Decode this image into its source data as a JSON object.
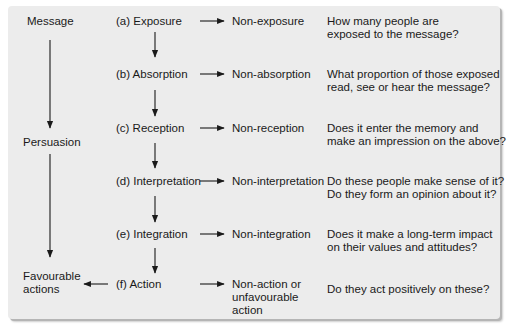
{
  "left_column": {
    "message": "Message",
    "persuasion": "Persuasion",
    "favourable_actions_line1": "Favourable",
    "favourable_actions_line2": "actions"
  },
  "stages": [
    {
      "label": "(a) Exposure",
      "negative": [
        "Non-exposure"
      ],
      "question": [
        "How many people are",
        "exposed to the message?"
      ]
    },
    {
      "label": "(b) Absorption",
      "negative": [
        "Non-absorption"
      ],
      "question": [
        "What proportion of those exposed",
        "read, see or hear the message?"
      ]
    },
    {
      "label": "(c) Reception",
      "negative": [
        "Non-reception"
      ],
      "question": [
        "Does it enter the memory and",
        "make an impression on the above?"
      ]
    },
    {
      "label": "(d) Interpretation",
      "negative": [
        "Non-interpretation"
      ],
      "question": [
        "Do these people make sense of it?",
        "Do they form an opinion about it?"
      ]
    },
    {
      "label": "(e) Integration",
      "negative": [
        "Non-integration"
      ],
      "question": [
        "Does it make a long-term impact",
        "on their values and attitudes?"
      ]
    },
    {
      "label": "(f)  Action",
      "negative": [
        "Non-action or",
        "unfavourable",
        "action"
      ],
      "question": [
        "Do they act positively on these?"
      ]
    }
  ],
  "colors": {
    "panel": "#ececec",
    "ink": "#1a1a1a",
    "shadow": "#b5b5b5"
  }
}
